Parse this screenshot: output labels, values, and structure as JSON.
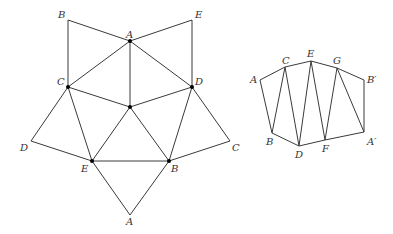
{
  "diagram": {
    "type": "geometry-nets",
    "figures": [
      {
        "name": "pentagonal-star-net",
        "labels": {
          "B_top": "B",
          "E_top": "E",
          "A_top": "A",
          "C": "C",
          "D": "D",
          "D_left": "D",
          "C_right": "C",
          "E_bottom": "E",
          "B_bottom": "B",
          "A_bottom": "A"
        }
      },
      {
        "name": "zigzag-strip",
        "labels": {
          "A": "A",
          "C": "C",
          "E": "E",
          "G": "G",
          "B_prime": "B′",
          "B": "B",
          "D": "D",
          "F": "F",
          "A_prime": "A′"
        }
      }
    ],
    "colors": {
      "line": "#3a3a3a",
      "vertex": "#000000",
      "label": "#333333",
      "background": "#ffffff"
    }
  }
}
